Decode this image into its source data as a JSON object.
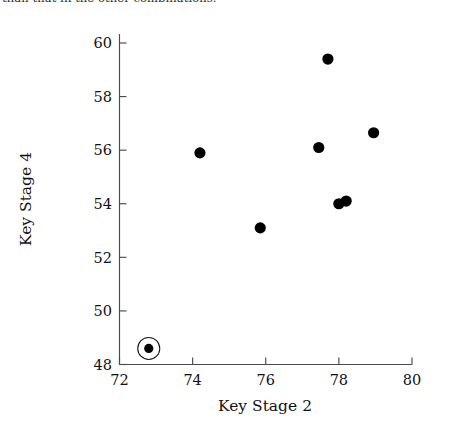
{
  "caption": {
    "text": "than that in the other combinations."
  },
  "chart_data": {
    "type": "scatter",
    "title": "",
    "xlabel": "Key Stage 2",
    "ylabel": "Key Stage 4",
    "xlim": [
      72,
      80
    ],
    "ylim": [
      48,
      60
    ],
    "xticks": [
      72,
      74,
      76,
      78,
      80
    ],
    "yticks": [
      48,
      50,
      52,
      54,
      56,
      58,
      60
    ],
    "grid": false,
    "legend": false,
    "marker": {
      "shape": "circle",
      "color": "#000000",
      "size": 5.6
    },
    "annotations": [
      {
        "type": "highlight-ring",
        "label": "circled outlier",
        "x": 72.8,
        "y": 48.6,
        "radius_px": 11
      }
    ],
    "points": [
      {
        "x": 72.8,
        "y": 48.6,
        "highlighted": true
      },
      {
        "x": 74.2,
        "y": 55.9,
        "highlighted": false
      },
      {
        "x": 75.85,
        "y": 53.1,
        "highlighted": false
      },
      {
        "x": 77.45,
        "y": 56.1,
        "highlighted": false
      },
      {
        "x": 77.7,
        "y": 59.4,
        "highlighted": false
      },
      {
        "x": 78.0,
        "y": 54.0,
        "highlighted": false
      },
      {
        "x": 78.2,
        "y": 54.1,
        "highlighted": false
      },
      {
        "x": 78.95,
        "y": 56.65,
        "highlighted": false
      }
    ]
  }
}
